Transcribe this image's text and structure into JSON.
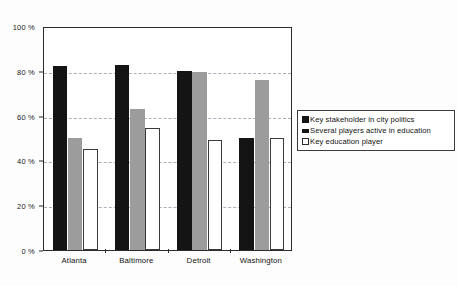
{
  "chart_data": {
    "type": "bar",
    "title": "",
    "subtitle": "",
    "xlabel": "",
    "ylabel": "",
    "categories": [
      "Atlanta",
      "Baltimore",
      "Detroit",
      "Washington"
    ],
    "series": [
      {
        "name": "Key stakeholder in city politics",
        "color": "#141414",
        "values": [
          82,
          82.5,
          80,
          50
        ]
      },
      {
        "name": "Several players active in education",
        "color": "#9c9c9c",
        "values": [
          50,
          63,
          79.5,
          76
        ]
      },
      {
        "name": "Key education player",
        "color": "#ffffff",
        "values": [
          45,
          54.5,
          49,
          50
        ]
      }
    ],
    "ylim": [
      0,
      100
    ],
    "ytick_values": [
      0,
      20,
      40,
      60,
      80,
      100
    ],
    "ytick_labels": [
      "0 %",
      "20 %",
      "40 %",
      "60 %",
      "80 %",
      "100 %"
    ],
    "gridlines": {
      "y_dashed_at": [
        20,
        40,
        60,
        80
      ],
      "x_grid": false,
      "style": "dashed"
    },
    "legend": {
      "position": "right",
      "entries": [
        {
          "label": "Key stakeholder in city politics",
          "swatch": "filled-black"
        },
        {
          "label": "Several players active in education",
          "swatch": "filled-gray"
        },
        {
          "label": "Key education player",
          "swatch": "outlined-white"
        }
      ]
    },
    "plot_border": true,
    "background_color": "#ffffff"
  }
}
